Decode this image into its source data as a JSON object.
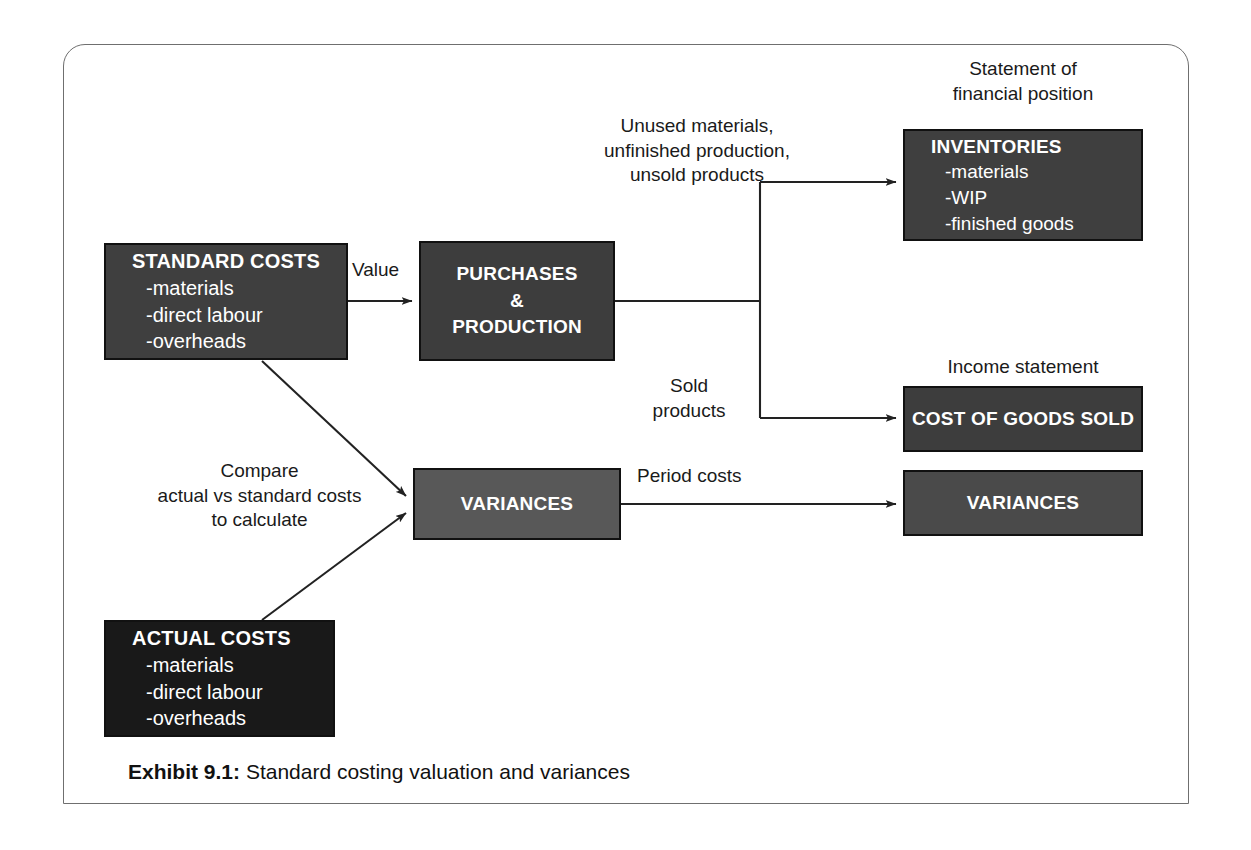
{
  "exhibit": {
    "caption_label": "Exhibit 9.1:",
    "caption_text": "Standard costing valuation and variances"
  },
  "nodes": {
    "standard_costs": {
      "title": "STANDARD COSTS",
      "lines": [
        "-materials",
        "-direct labour",
        "-overheads"
      ],
      "fill": "#3f3f3f"
    },
    "actual_costs": {
      "title": "ACTUAL COSTS",
      "lines": [
        "-materials",
        "-direct labour",
        "-overheads"
      ],
      "fill": "#191919"
    },
    "purchases_production": {
      "line1": "PURCHASES",
      "line2": "&",
      "line3": "PRODUCTION",
      "fill": "#3d3d3d"
    },
    "inventories": {
      "title": "INVENTORIES",
      "lines": [
        "-materials",
        "-WIP",
        "-finished goods"
      ],
      "fill": "#3f3f3f"
    },
    "cost_of_goods_sold": {
      "title": "COST OF GOODS SOLD",
      "fill": "#3d3d3d"
    },
    "variances_mid": {
      "title": "VARIANCES",
      "fill": "#585858"
    },
    "variances_right": {
      "title": "VARIANCES",
      "fill": "#4a4a4a"
    }
  },
  "edge_labels": {
    "value": "Value",
    "unused": "Unused materials,\nunfinished production,\nunsold products",
    "sold": "Sold\nproducts",
    "compare": "Compare\nactual vs standard costs\nto calculate",
    "period_costs": "Period costs"
  },
  "section_headings": {
    "statement_of_financial_position": "Statement of\nfinancial position",
    "income_statement": "Income statement"
  },
  "colors": {
    "frame_border": "#6f6f6f",
    "connector": "#222222",
    "box_border": "#111111",
    "text_on_dark": "#ffffff",
    "text_dark": "#1a1a1a"
  }
}
